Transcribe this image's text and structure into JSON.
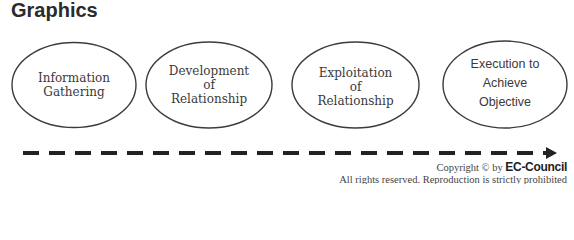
{
  "title": "Graphics",
  "stages": [
    {
      "lines": [
        "Information",
        "Gathering"
      ]
    },
    {
      "lines": [
        "Development",
        "of",
        "Relationship"
      ]
    },
    {
      "lines": [
        "Exploitation",
        "of",
        "Relationship"
      ]
    },
    {
      "lines": [
        "Execution to",
        "Achieve",
        "Objective"
      ]
    }
  ],
  "timeline": {
    "direction": "left-to-right",
    "style": "dashed-arrow"
  },
  "copyright": {
    "prefix": "Copyright © by",
    "brand": "EC-Council",
    "notice": "All rights reserved. Reproduction is strictly prohibited"
  }
}
